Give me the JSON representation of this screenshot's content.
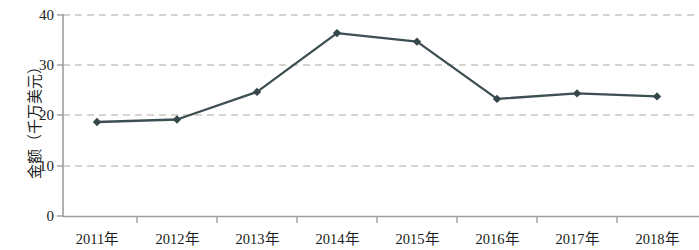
{
  "chart_data": {
    "type": "line",
    "title": "",
    "xlabel": "",
    "ylabel": "金额（千万美元）",
    "categories": [
      "2011年",
      "2012年",
      "2013年",
      "2014年",
      "2015年",
      "2016年",
      "2017年",
      "2018年"
    ],
    "values": [
      18.7,
      19.2,
      24.7,
      36.4,
      34.7,
      23.3,
      24.4,
      23.8
    ],
    "series": [
      {
        "name": "金额",
        "values": [
          18.7,
          19.2,
          24.7,
          36.4,
          34.7,
          23.3,
          24.4,
          23.8
        ]
      }
    ],
    "ylim": [
      0,
      40
    ],
    "yticks": [
      0,
      10,
      20,
      30,
      40
    ],
    "ytick_labels": [
      "0",
      "10",
      "20",
      "30",
      "40"
    ],
    "grid": true,
    "grid_axis": "y",
    "grid_style": "dashed",
    "legend": false,
    "legend_position": "none",
    "marker": "diamond",
    "colors": {
      "line": "#3d4f52",
      "marker": "#35474a",
      "grid": "#c9c6bd",
      "axis": "#9e9e9e",
      "text": "#1b1b1b",
      "background": "#ffffff"
    }
  },
  "axis": {
    "y_title": "金额（千万美元）",
    "y_labels": [
      "40",
      "30",
      "20",
      "10",
      "0"
    ],
    "x_labels": [
      "2011年",
      "2012年",
      "2013年",
      "2014年",
      "2015年",
      "2016年",
      "2017年",
      "2018年"
    ]
  }
}
